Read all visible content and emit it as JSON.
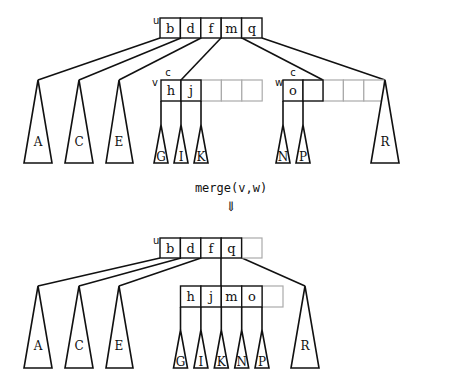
{
  "diagram": {
    "colors": {
      "stroke": "#111111",
      "empty_cell": "#aaaaaa",
      "background": "#ffffff"
    },
    "before": {
      "root": {
        "label": "u",
        "keys": [
          "b",
          "d",
          "f",
          "m",
          "q"
        ]
      },
      "left_subtrees": [
        "A",
        "C",
        "E"
      ],
      "node_v": {
        "label": "v",
        "keys": [
          "h",
          "j"
        ],
        "empty_slots": 3,
        "marker": "c",
        "subtrees": [
          "G",
          "I",
          "K"
        ]
      },
      "node_w": {
        "label": "w",
        "keys": [
          "o",
          ""
        ],
        "empty_slots": 3,
        "marker": "c",
        "subtrees": [
          "N",
          "P"
        ]
      },
      "right_subtree": "R"
    },
    "operation": {
      "label": "merge(v,w)",
      "arrow": "⇓"
    },
    "after": {
      "root": {
        "label": "u",
        "keys": [
          "b",
          "d",
          "f",
          "q"
        ],
        "empty_slots": 1
      },
      "left_subtrees": [
        "A",
        "C",
        "E"
      ],
      "merged_node": {
        "keys": [
          "h",
          "j",
          "m",
          "o"
        ],
        "empty_slots": 1,
        "subtrees": [
          "G",
          "I",
          "K",
          "N",
          "P"
        ]
      },
      "right_subtree": "R"
    }
  }
}
